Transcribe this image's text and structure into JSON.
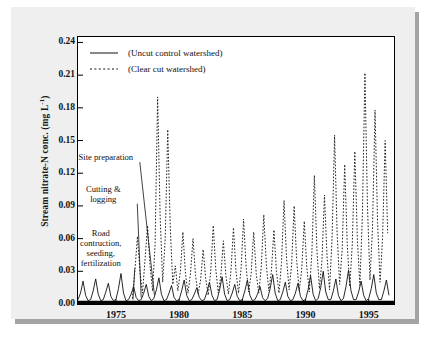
{
  "chart_data": {
    "type": "line",
    "title": "",
    "xlabel": "",
    "ylabel": "Stream nitrate-N conc. (mg L-1)",
    "ylabel_main": "Stream nitrate-N conc. (mg L",
    "ylabel_sup": "-1",
    "ylabel_tail": ")",
    "xlim": [
      1972.0,
      1997.0
    ],
    "ylim": [
      0.0,
      0.245
    ],
    "grid": false,
    "legend_position": "top-left inside plot",
    "ytick_labels": [
      "0.24",
      "0.21",
      "0.18",
      "0.15",
      "0.12",
      "0.09",
      "0.06",
      "0.03",
      "0.00"
    ],
    "ytick_values": [
      0.24,
      0.21,
      0.18,
      0.15,
      0.12,
      0.09,
      0.06,
      0.03,
      0.0
    ],
    "xtick_labels": [
      "1975",
      "1980",
      "1985",
      "1990",
      "1995"
    ],
    "xtick_values": [
      1975,
      1980,
      1985,
      1990,
      1995
    ],
    "legend": [
      {
        "label": "(Uncut control watershed)",
        "style": "solid",
        "color": "#111111"
      },
      {
        "label": "(Clear cut watershed)",
        "style": "dashed",
        "color": "#111111"
      }
    ],
    "annotations": [
      {
        "text": "Site preparation",
        "lines": [
          "Site preparation"
        ],
        "x": 1974.2,
        "y": 0.132
      },
      {
        "text": "Cutting & logging",
        "lines": [
          "Cutting &",
          "logging"
        ],
        "x": 1974.0,
        "y": 0.103
      },
      {
        "text": "Road contruction, seeding, fertilization",
        "lines": [
          "Road",
          "contruction,",
          "seeding,",
          "fertilization"
        ],
        "x": 1973.8,
        "y": 0.062
      }
    ],
    "series": [
      {
        "name": "(Uncut control watershed)",
        "style": "solid",
        "x": [
          1972.0,
          1972.2,
          1972.4,
          1972.6,
          1972.8,
          1973.0,
          1973.2,
          1973.4,
          1973.6,
          1973.8,
          1974.0,
          1974.2,
          1974.4,
          1974.6,
          1974.8,
          1975.0,
          1975.2,
          1975.4,
          1975.6,
          1975.8,
          1976.0,
          1976.2,
          1976.4,
          1976.6,
          1976.8,
          1977.0,
          1977.2,
          1977.4,
          1977.6,
          1977.8,
          1978.0,
          1978.2,
          1978.4,
          1978.6,
          1978.8,
          1979.0,
          1979.2,
          1979.4,
          1979.6,
          1979.8,
          1980.0,
          1980.2,
          1980.4,
          1980.6,
          1980.8,
          1981.0,
          1981.2,
          1981.4,
          1981.6,
          1981.8,
          1982.0,
          1982.2,
          1982.4,
          1982.6,
          1982.8,
          1983.0,
          1983.2,
          1983.4,
          1983.6,
          1983.8,
          1984.0,
          1984.2,
          1984.4,
          1984.6,
          1984.8,
          1985.0,
          1985.2,
          1985.4,
          1985.6,
          1985.8,
          1986.0,
          1986.2,
          1986.4,
          1986.6,
          1986.8,
          1987.0,
          1987.2,
          1987.4,
          1987.6,
          1987.8,
          1988.0,
          1988.2,
          1988.4,
          1988.6,
          1988.8,
          1989.0,
          1989.2,
          1989.4,
          1989.6,
          1989.8,
          1990.0,
          1990.2,
          1990.4,
          1990.6,
          1990.8,
          1991.0,
          1991.2,
          1991.4,
          1991.6,
          1991.8,
          1992.0,
          1992.2,
          1992.4,
          1992.6,
          1992.8,
          1993.0,
          1993.2,
          1993.4,
          1993.6,
          1993.8,
          1994.0,
          1994.2,
          1994.4,
          1994.6,
          1994.8,
          1995.0,
          1995.2,
          1995.4,
          1995.6,
          1995.8,
          1996.0,
          1996.2,
          1996.4,
          1996.6
        ],
        "y": [
          0.004,
          0.01,
          0.021,
          0.008,
          0.003,
          0.004,
          0.012,
          0.023,
          0.009,
          0.003,
          0.004,
          0.011,
          0.019,
          0.007,
          0.003,
          0.004,
          0.014,
          0.028,
          0.01,
          0.003,
          0.004,
          0.009,
          0.016,
          0.006,
          0.003,
          0.004,
          0.01,
          0.018,
          0.007,
          0.003,
          0.005,
          0.013,
          0.024,
          0.009,
          0.003,
          0.004,
          0.01,
          0.017,
          0.006,
          0.003,
          0.004,
          0.012,
          0.022,
          0.008,
          0.003,
          0.004,
          0.009,
          0.015,
          0.006,
          0.003,
          0.004,
          0.011,
          0.02,
          0.008,
          0.003,
          0.004,
          0.013,
          0.025,
          0.009,
          0.003,
          0.004,
          0.01,
          0.018,
          0.007,
          0.003,
          0.004,
          0.012,
          0.022,
          0.008,
          0.003,
          0.004,
          0.009,
          0.016,
          0.006,
          0.003,
          0.005,
          0.014,
          0.027,
          0.01,
          0.003,
          0.004,
          0.011,
          0.02,
          0.007,
          0.003,
          0.004,
          0.01,
          0.019,
          0.007,
          0.003,
          0.004,
          0.013,
          0.026,
          0.009,
          0.003,
          0.005,
          0.015,
          0.03,
          0.011,
          0.004,
          0.004,
          0.012,
          0.023,
          0.008,
          0.003,
          0.005,
          0.016,
          0.031,
          0.012,
          0.004,
          0.004,
          0.011,
          0.021,
          0.008,
          0.003,
          0.005,
          0.014,
          0.027,
          0.01,
          0.004,
          0.004,
          0.012,
          0.022,
          0.008
        ]
      },
      {
        "name": "(Clear cut watershed)",
        "style": "dashed",
        "x": [
          1976.3,
          1976.5,
          1976.7,
          1976.9,
          1977.1,
          1977.3,
          1977.5,
          1977.7,
          1977.9,
          1978.1,
          1978.3,
          1978.5,
          1978.7,
          1978.9,
          1979.1,
          1979.3,
          1979.5,
          1979.7,
          1979.9,
          1980.1,
          1980.3,
          1980.5,
          1980.7,
          1980.9,
          1981.1,
          1981.3,
          1981.5,
          1981.7,
          1981.9,
          1982.1,
          1982.3,
          1982.5,
          1982.7,
          1982.9,
          1983.1,
          1983.3,
          1983.5,
          1983.7,
          1983.9,
          1984.1,
          1984.3,
          1984.5,
          1984.7,
          1984.9,
          1985.1,
          1985.3,
          1985.5,
          1985.7,
          1985.9,
          1986.1,
          1986.3,
          1986.5,
          1986.7,
          1986.9,
          1987.1,
          1987.3,
          1987.5,
          1987.7,
          1987.9,
          1988.1,
          1988.3,
          1988.5,
          1988.7,
          1988.9,
          1989.1,
          1989.3,
          1989.5,
          1989.7,
          1989.9,
          1990.1,
          1990.3,
          1990.5,
          1990.7,
          1990.9,
          1991.1,
          1991.3,
          1991.5,
          1991.7,
          1991.9,
          1992.1,
          1992.3,
          1992.5,
          1992.7,
          1992.9,
          1993.1,
          1993.3,
          1993.5,
          1993.7,
          1993.9,
          1994.1,
          1994.3,
          1994.5,
          1994.7,
          1994.9,
          1995.1,
          1995.3,
          1995.5,
          1995.7,
          1995.9,
          1996.1,
          1996.3,
          1996.5
        ],
        "y": [
          0.005,
          0.03,
          0.062,
          0.03,
          0.01,
          0.04,
          0.072,
          0.035,
          0.012,
          0.055,
          0.19,
          0.08,
          0.02,
          0.06,
          0.16,
          0.07,
          0.018,
          0.035,
          0.012,
          0.03,
          0.066,
          0.028,
          0.01,
          0.028,
          0.06,
          0.026,
          0.009,
          0.022,
          0.05,
          0.024,
          0.008,
          0.03,
          0.072,
          0.032,
          0.01,
          0.026,
          0.058,
          0.026,
          0.009,
          0.03,
          0.07,
          0.03,
          0.01,
          0.032,
          0.078,
          0.034,
          0.011,
          0.028,
          0.066,
          0.028,
          0.01,
          0.034,
          0.082,
          0.036,
          0.012,
          0.03,
          0.068,
          0.03,
          0.01,
          0.038,
          0.095,
          0.042,
          0.013,
          0.036,
          0.09,
          0.04,
          0.012,
          0.032,
          0.076,
          0.034,
          0.011,
          0.046,
          0.118,
          0.05,
          0.014,
          0.04,
          0.1,
          0.044,
          0.013,
          0.06,
          0.155,
          0.065,
          0.018,
          0.05,
          0.128,
          0.055,
          0.016,
          0.055,
          0.14,
          0.06,
          0.017,
          0.082,
          0.212,
          0.09,
          0.022,
          0.07,
          0.178,
          0.075,
          0.02,
          0.062,
          0.15,
          0.065
        ]
      }
    ]
  }
}
